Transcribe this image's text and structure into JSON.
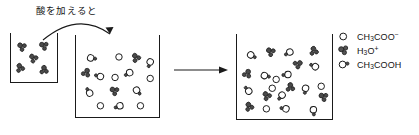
{
  "figure": {
    "title_text": "酸を加えると"
  },
  "annotations": {
    "add_acid_label": "酸を加えると",
    "curved_arrow": "curved-arrow-beaker1-to-beaker2",
    "straight_arrow": "straight-arrow-beaker2-to-beaker3"
  },
  "legend": {
    "items": [
      {
        "glyph": "open-circle",
        "label": "CH3COO-",
        "formula_base": "CH",
        "sub1": "3",
        "rest": "COO",
        "charge": "−"
      },
      {
        "glyph": "cluster",
        "label": "H3O+",
        "formula_base": "H",
        "sub1": "3",
        "rest": "O",
        "charge": "+"
      },
      {
        "glyph": "circle-with-dot",
        "label": "CH3COOH",
        "formula_base": "CH",
        "sub1": "3",
        "rest": "COOH",
        "charge": ""
      }
    ]
  },
  "beakers": [
    {
      "name": "beaker-left",
      "x": 10,
      "y": 33,
      "w": 48,
      "h": 50,
      "particles": [
        {
          "type": "cluster",
          "x": 11,
          "y": 14,
          "r": 18
        },
        {
          "type": "cluster",
          "x": 34,
          "y": 13,
          "r": 8
        },
        {
          "type": "cluster",
          "x": 23,
          "y": 26,
          "r": 30
        },
        {
          "type": "cluster",
          "x": 9,
          "y": 36,
          "r": 52
        },
        {
          "type": "cluster",
          "x": 34,
          "y": 38,
          "r": 70
        }
      ]
    },
    {
      "name": "beaker-middle",
      "x": 75,
      "y": 35,
      "w": 85,
      "h": 83,
      "particles": [
        {
          "type": "circle-dot",
          "x": 15,
          "y": 23,
          "r": 20
        },
        {
          "type": "circle",
          "x": 44,
          "y": 22,
          "r": 0
        },
        {
          "type": "cluster",
          "x": 61,
          "y": 23,
          "r": 40
        },
        {
          "type": "circle-dot",
          "x": 76,
          "y": 27,
          "r": 120
        },
        {
          "type": "cluster",
          "x": 10,
          "y": 38,
          "r": 95
        },
        {
          "type": "circle-dot",
          "x": 25,
          "y": 42,
          "r": 205
        },
        {
          "type": "circle",
          "x": 40,
          "y": 43,
          "r": 0
        },
        {
          "type": "circle-dot",
          "x": 55,
          "y": 38,
          "r": 160
        },
        {
          "type": "circle",
          "x": 76,
          "y": 44,
          "r": 0
        },
        {
          "type": "circle-dot",
          "x": 14,
          "y": 59,
          "r": 250
        },
        {
          "type": "cluster",
          "x": 39,
          "y": 57,
          "r": 15
        },
        {
          "type": "circle-dot",
          "x": 62,
          "y": 56,
          "r": 60
        },
        {
          "type": "circle",
          "x": 25,
          "y": 72,
          "r": 0
        },
        {
          "type": "circle-dot",
          "x": 45,
          "y": 72,
          "r": 170
        },
        {
          "type": "circle",
          "x": 66,
          "y": 72,
          "r": 0
        }
      ]
    },
    {
      "name": "beaker-right",
      "x": 236,
      "y": 34,
      "w": 97,
      "h": 86,
      "particles": [
        {
          "type": "circle-dot",
          "x": 14,
          "y": 21,
          "r": 40
        },
        {
          "type": "cluster",
          "x": 34,
          "y": 18,
          "r": 20
        },
        {
          "type": "circle-dot",
          "x": 54,
          "y": 18,
          "r": 160
        },
        {
          "type": "cluster",
          "x": 78,
          "y": 17,
          "r": 60
        },
        {
          "type": "cluster",
          "x": 62,
          "y": 30,
          "r": 130
        },
        {
          "type": "circle-dot",
          "x": 80,
          "y": 33,
          "r": 215
        },
        {
          "type": "cluster",
          "x": 10,
          "y": 40,
          "r": 95
        },
        {
          "type": "circle-dot",
          "x": 28,
          "y": 42,
          "r": 25
        },
        {
          "type": "circle",
          "x": 40,
          "y": 46,
          "r": 0
        },
        {
          "type": "circle-dot",
          "x": 52,
          "y": 41,
          "r": 185
        },
        {
          "type": "circle",
          "x": 36,
          "y": 55,
          "r": 0
        },
        {
          "type": "cluster",
          "x": 54,
          "y": 54,
          "r": 70
        },
        {
          "type": "circle-dot",
          "x": 70,
          "y": 55,
          "r": 110
        },
        {
          "type": "circle",
          "x": 86,
          "y": 53,
          "r": 0
        },
        {
          "type": "circle-dot",
          "x": 12,
          "y": 58,
          "r": 240
        },
        {
          "type": "cluster",
          "x": 30,
          "y": 63,
          "r": 35
        },
        {
          "type": "circle-dot",
          "x": 46,
          "y": 62,
          "r": 140
        },
        {
          "type": "cluster",
          "x": 88,
          "y": 64,
          "r": 10
        },
        {
          "type": "cluster",
          "x": 12,
          "y": 74,
          "r": 50
        },
        {
          "type": "circle",
          "x": 30,
          "y": 76,
          "r": 0
        },
        {
          "type": "circle-dot",
          "x": 50,
          "y": 76,
          "r": 200
        },
        {
          "type": "circle-dot",
          "x": 78,
          "y": 77,
          "r": 95
        }
      ]
    }
  ],
  "colors": {
    "ink": "#1a1a1a",
    "particle_fill": "#ffffff",
    "cluster_fill": "#4a4a4a",
    "background": "#ffffff"
  }
}
